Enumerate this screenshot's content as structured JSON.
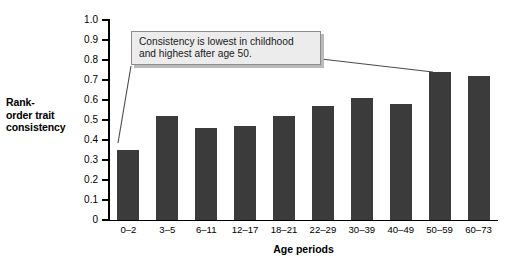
{
  "chart_data": {
    "type": "bar",
    "title": "",
    "xlabel": "Age periods",
    "ylabel": "Rank-order trait consistency",
    "ylabel_lines": [
      "Rank-",
      "order trait",
      "consistency"
    ],
    "categories": [
      "0–2",
      "3–5",
      "6–11",
      "12–17",
      "18–21",
      "22–29",
      "30–39",
      "40–49",
      "50–59",
      "60–73"
    ],
    "values": [
      0.35,
      0.52,
      0.46,
      0.47,
      0.52,
      0.57,
      0.61,
      0.58,
      0.74,
      0.72
    ],
    "ylim": [
      0,
      1.0
    ],
    "ytick_step": 0.1,
    "ytick_labels": [
      "1.0",
      "0.9",
      "0.8",
      "0.7",
      "0.6",
      "0.5",
      "0.4",
      "0.3",
      "0.2",
      "0.1",
      "0"
    ],
    "grid": false,
    "legend": null,
    "bar_color": "#3b3b3b",
    "annotations": [
      {
        "text": "Consistency is lowest in childhood\nand highest after age 50.",
        "points_to": [
          "0–2",
          "50–59"
        ],
        "box_fill": "#ececec",
        "box_border": "#8c8c8c"
      }
    ]
  }
}
